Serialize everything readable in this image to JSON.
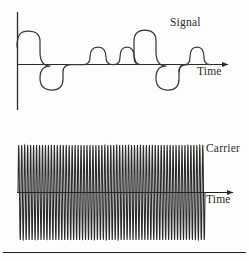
{
  "figure": {
    "background_color": "#fdfdfc",
    "ink_color": "#2b2b2b",
    "panels": [
      {
        "id": "signal-panel",
        "label": "Signal",
        "time_axis_label": "Time",
        "has_vertical_axis": true,
        "waveform": "pulse-train"
      },
      {
        "id": "carrier-panel",
        "label": "Carrier",
        "time_axis_label": "Time",
        "has_vertical_axis": false,
        "waveform": "high-frequency-sine"
      }
    ]
  },
  "labels": {
    "signal": "Signal",
    "signal_time": "Time",
    "carrier": "Carrier",
    "carrier_time": "Time"
  },
  "chart_data": {
    "type": "line",
    "charts": [
      {
        "name": "Signal",
        "type": "line",
        "xlabel": "Time",
        "ylabel": "",
        "xlim": [
          0,
          1
        ],
        "ylim": [
          -1.1,
          1.1
        ],
        "grid": false,
        "legend_position": "top-right",
        "annotation": "Signal",
        "description": "Bipolar rounded pulse train: alternating wide positive/negative lobes with pairs of narrow half-amplitude positive pulses.",
        "amplitude_levels": {
          "wide_positive": 1.0,
          "wide_negative": -1.0,
          "narrow_positive": 0.45
        },
        "pulses": [
          {
            "center_x": 0.06,
            "half_width": 0.05,
            "amplitude": 1.0,
            "kind": "wide-positive"
          },
          {
            "center_x": 0.175,
            "half_width": 0.055,
            "amplitude": -1.0,
            "kind": "wide-negative"
          },
          {
            "center_x": 0.33,
            "half_width": 0.028,
            "amplitude": 0.45,
            "kind": "narrow-positive"
          },
          {
            "center_x": 0.395,
            "half_width": 0.022,
            "amplitude": 0.45,
            "kind": "narrow-positive"
          },
          {
            "center_x": 0.48,
            "half_width": 0.048,
            "amplitude": 1.0,
            "kind": "wide-positive"
          },
          {
            "center_x": 0.6,
            "half_width": 0.055,
            "amplitude": -1.0,
            "kind": "wide-negative"
          },
          {
            "center_x": 0.745,
            "half_width": 0.052,
            "amplitude": -1.0,
            "kind": "wide-negative"
          },
          {
            "center_x": 0.855,
            "half_width": 0.026,
            "amplitude": 0.45,
            "kind": "narrow-positive"
          },
          {
            "center_x": 0.915,
            "half_width": 0.022,
            "amplitude": 0.45,
            "kind": "narrow-positive"
          }
        ]
      },
      {
        "name": "Carrier",
        "type": "line",
        "xlabel": "Time",
        "ylabel": "",
        "xlim": [
          0,
          1
        ],
        "ylim": [
          -1.1,
          1.1
        ],
        "grid": false,
        "legend_position": "top-right",
        "annotation": "Carrier",
        "description": "Constant-amplitude high-frequency sinusoid spanning the full time axis.",
        "amplitude": 1.0,
        "cycles": 63,
        "waveform": "sine"
      }
    ]
  }
}
